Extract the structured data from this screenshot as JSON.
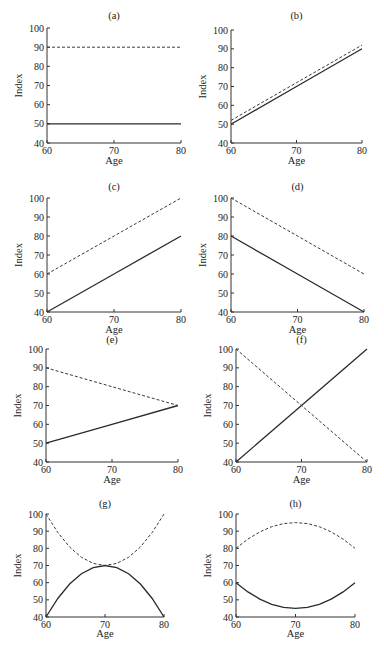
{
  "figure": {
    "panel_count": 8,
    "line_styles": {
      "solid": "#2a2a2a",
      "dashed": "#3a3a3a"
    }
  },
  "chart_data": [
    {
      "type": "line",
      "title": "(a)",
      "xlabel": "Age",
      "ylabel": "Index",
      "xlim": [
        60,
        80
      ],
      "ylim": [
        40,
        100
      ],
      "xticks": [
        60,
        70,
        80
      ],
      "yticks": [
        40,
        50,
        60,
        70,
        80,
        90,
        100
      ],
      "grid": false,
      "legend": null,
      "x": [
        60,
        70,
        80
      ],
      "series": [
        {
          "name": "solid",
          "style": "solid",
          "values": [
            50,
            50,
            50
          ]
        },
        {
          "name": "dashed",
          "style": "dashed",
          "values": [
            90,
            90,
            90
          ]
        }
      ],
      "layout": {
        "x0": 47,
        "x1": 181,
        "yTop": 28,
        "yBottom": 143,
        "titleY": 19,
        "agePresent": true,
        "ageY": 164
      }
    },
    {
      "type": "line",
      "title": "(b)",
      "xlabel": "Age",
      "ylabel": "Index",
      "xlim": [
        60,
        80
      ],
      "ylim": [
        40,
        100
      ],
      "xticks": [
        60,
        70,
        80
      ],
      "yticks": [
        40,
        50,
        60,
        70,
        80,
        90,
        100
      ],
      "grid": false,
      "legend": null,
      "x": [
        60,
        70,
        80
      ],
      "series": [
        {
          "name": "solid",
          "style": "solid",
          "values": [
            50,
            70,
            90
          ]
        },
        {
          "name": "dashed",
          "style": "dashed",
          "values": [
            52,
            72,
            92
          ]
        }
      ],
      "layout": {
        "x0": 231,
        "x1": 362,
        "yTop": 30,
        "yBottom": 143,
        "titleY": 19,
        "agePresent": true,
        "ageY": 164
      }
    },
    {
      "type": "line",
      "title": "(c)",
      "xlabel": "Age",
      "ylabel": "Index",
      "xlim": [
        60,
        80
      ],
      "ylim": [
        40,
        100
      ],
      "xticks": [
        60,
        70,
        80
      ],
      "yticks": [
        40,
        50,
        60,
        70,
        80,
        90,
        100
      ],
      "grid": false,
      "legend": null,
      "x": [
        60,
        70,
        80
      ],
      "series": [
        {
          "name": "solid",
          "style": "solid",
          "values": [
            40,
            60,
            80
          ]
        },
        {
          "name": "dashed",
          "style": "dashed",
          "values": [
            60,
            80,
            100
          ]
        }
      ],
      "layout": {
        "x0": 47,
        "x1": 181,
        "yTop": 198,
        "yBottom": 312,
        "titleY": 190,
        "agePresent": true,
        "ageY": 333
      }
    },
    {
      "type": "line",
      "title": "(d)",
      "xlabel": "Age",
      "ylabel": "Index",
      "xlim": [
        60,
        80
      ],
      "ylim": [
        40,
        100
      ],
      "xticks": [
        60,
        70,
        80
      ],
      "yticks": [
        40,
        50,
        60,
        70,
        80,
        90,
        100
      ],
      "grid": false,
      "legend": null,
      "x": [
        60,
        70,
        80
      ],
      "series": [
        {
          "name": "solid",
          "style": "solid",
          "values": [
            80,
            60,
            40
          ]
        },
        {
          "name": "dashed",
          "style": "dashed",
          "values": [
            100,
            80,
            60
          ]
        }
      ],
      "layout": {
        "x0": 231,
        "x1": 364,
        "yTop": 198,
        "yBottom": 312,
        "titleY": 190,
        "agePresent": true,
        "ageY": 333
      }
    },
    {
      "type": "line",
      "title": "(e)",
      "xlabel": "Age",
      "ylabel": "Index",
      "xlim": [
        60,
        80
      ],
      "ylim": [
        40,
        100
      ],
      "xticks": [
        60,
        70,
        80
      ],
      "yticks": [
        40,
        50,
        60,
        70,
        80,
        90,
        100
      ],
      "grid": false,
      "legend": null,
      "x": [
        60,
        70,
        80
      ],
      "series": [
        {
          "name": "solid",
          "style": "solid",
          "values": [
            50,
            60,
            70
          ]
        },
        {
          "name": "dashed",
          "style": "dashed",
          "values": [
            90,
            80,
            70
          ]
        }
      ],
      "layout": {
        "x0": 46,
        "x1": 178,
        "yTop": 349,
        "yBottom": 462,
        "titleY": 343,
        "agePresent": true,
        "ageY": 483
      }
    },
    {
      "type": "line",
      "title": "(f)",
      "xlabel": "Age",
      "ylabel": "Index",
      "xlim": [
        60,
        80
      ],
      "ylim": [
        40,
        100
      ],
      "xticks": [
        60,
        70,
        80
      ],
      "yticks": [
        40,
        50,
        60,
        70,
        80,
        90,
        100
      ],
      "grid": false,
      "legend": null,
      "x": [
        60,
        70,
        80
      ],
      "series": [
        {
          "name": "solid",
          "style": "solid",
          "values": [
            40,
            70,
            100
          ]
        },
        {
          "name": "dashed",
          "style": "dashed",
          "values": [
            100,
            70,
            40
          ]
        }
      ],
      "layout": {
        "x0": 236,
        "x1": 367,
        "yTop": 349,
        "yBottom": 462,
        "titleY": 343,
        "agePresent": true,
        "ageY": 483
      }
    },
    {
      "type": "line",
      "title": "(g)",
      "xlabel": "Age",
      "ylabel": "Index",
      "xlim": [
        60,
        80
      ],
      "ylim": [
        40,
        100
      ],
      "xticks": [
        60,
        70,
        80
      ],
      "yticks": [
        40,
        50,
        60,
        70,
        80,
        90,
        100
      ],
      "grid": false,
      "legend": null,
      "x": [
        60,
        62,
        64,
        66,
        68,
        70,
        72,
        74,
        76,
        78,
        80
      ],
      "series": [
        {
          "name": "solid",
          "style": "solid",
          "values": [
            40,
            50.8,
            59.2,
            65.2,
            68.8,
            70,
            68.8,
            65.2,
            59.2,
            50.8,
            40
          ]
        },
        {
          "name": "dashed",
          "style": "dashed",
          "values": [
            100,
            89.2,
            80.8,
            74.8,
            71.2,
            70,
            71.2,
            74.8,
            80.8,
            89.2,
            100
          ]
        }
      ],
      "layout": {
        "x0": 46,
        "x1": 164,
        "yTop": 514,
        "yBottom": 617,
        "titleY": 507,
        "agePresent": true,
        "ageY": 637
      }
    },
    {
      "type": "line",
      "title": "(h)",
      "xlabel": "Age",
      "ylabel": "Index",
      "xlim": [
        60,
        80
      ],
      "ylim": [
        40,
        100
      ],
      "xticks": [
        60,
        70,
        80
      ],
      "yticks": [
        40,
        50,
        60,
        70,
        80,
        90,
        100
      ],
      "grid": false,
      "legend": null,
      "x": [
        60,
        62,
        64,
        66,
        68,
        70,
        72,
        74,
        76,
        78,
        80
      ],
      "series": [
        {
          "name": "solid",
          "style": "solid",
          "values": [
            60,
            54.6,
            50.4,
            47.4,
            45.6,
            45,
            45.6,
            47.4,
            50.4,
            54.6,
            60
          ]
        },
        {
          "name": "dashed",
          "style": "dashed",
          "values": [
            80,
            85.4,
            89.6,
            92.6,
            94.4,
            95,
            94.4,
            92.6,
            89.6,
            85.4,
            80
          ]
        }
      ],
      "layout": {
        "x0": 236,
        "x1": 355,
        "yTop": 514,
        "yBottom": 617,
        "titleY": 507,
        "agePresent": true,
        "ageY": 637
      }
    }
  ]
}
